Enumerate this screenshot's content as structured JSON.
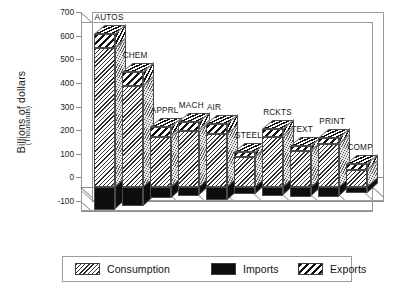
{
  "chart_data": {
    "type": "bar",
    "title": "",
    "subtitle": "",
    "xlabel": "",
    "ylabel": "Billions of dollars",
    "ylabel_sub": "(Thousands)",
    "ylim": [
      -100,
      700
    ],
    "yticks": [
      700,
      600,
      500,
      400,
      300,
      200,
      100,
      0,
      -100
    ],
    "ytick_labels": [
      "700",
      "600",
      "500",
      "400",
      "300",
      "200",
      "100",
      "0",
      "-100"
    ],
    "grid": false,
    "legend_position": "bottom",
    "stacked": true,
    "three_d": true,
    "categories": [
      "AUTOS",
      "CHEM",
      "APPRL",
      "MACH",
      "AIR",
      "STEEL",
      "RCKTS",
      "TEXT",
      "PRINT",
      "COMP"
    ],
    "series": [
      {
        "name": "Consumption",
        "pattern": "fine-diagonal-hatch",
        "values": [
          590,
          430,
          215,
          240,
          225,
          130,
          215,
          155,
          185,
          75
        ]
      },
      {
        "name": "Exports",
        "pattern": "bold-diagonal-hatch",
        "values": [
          60,
          60,
          40,
          35,
          45,
          20,
          30,
          20,
          25,
          25
        ]
      },
      {
        "name": "Imports",
        "pattern": "solid-black",
        "values": [
          -95,
          -80,
          -45,
          -35,
          -55,
          -30,
          -35,
          -40,
          -40,
          -25
        ]
      }
    ],
    "bar_totals": [
      650,
      490,
      255,
      275,
      270,
      150,
      245,
      175,
      210,
      100
    ]
  },
  "legend": {
    "items": [
      {
        "label": "Consumption",
        "swatch": "fine-diagonal-hatch",
        "color": "#2e2e2e"
      },
      {
        "label": "Imports",
        "swatch": "solid-black",
        "color": "#0d0d0d"
      },
      {
        "label": "Exports",
        "swatch": "bold-diagonal-hatch",
        "color": "#111111"
      }
    ]
  },
  "colors": {
    "background": "#ffffff",
    "axis": "#9a9a9a",
    "text": "#141414",
    "bar_outline": "#4a4a4a",
    "bar_side": "#d8d8d8"
  }
}
